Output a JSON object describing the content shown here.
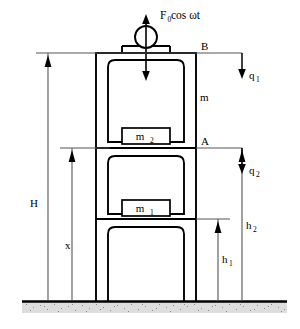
{
  "figure": {
    "background_color": "#ffffff",
    "line_color": "#000000",
    "ground_fill": "#d9d9d9"
  },
  "labels": {
    "force": "F",
    "force_sub": "0",
    "force_rest": " cos ωt",
    "point_b": "B",
    "point_a": "A",
    "column_mass": "m",
    "mass_2": "m",
    "mass_2_sub": "2",
    "mass_1": "m",
    "mass_1_sub": "1",
    "dim_H": "H",
    "dim_x": "x",
    "dim_h1": "h",
    "dim_h1_sub": "1",
    "dim_h2": "h",
    "dim_h2_sub": "2",
    "dof_q1": "q",
    "dof_q1_sub": "1",
    "dof_q2": "q",
    "dof_q2_sub": "2"
  },
  "geometry": {
    "ground_y": 300,
    "frame_left": 96,
    "frame_right": 196,
    "frame_top": 53,
    "level_b_y": 53,
    "level_a_y": 148,
    "level_mid_y": 219,
    "H_line_x": 48,
    "x_line_x": 72,
    "h1_line_x": 218,
    "h2_line_x": 242,
    "circle_cx": 146,
    "circle_cy": 37,
    "circle_r": 11
  },
  "masses": [
    {
      "name": "m2",
      "label": "m",
      "sub": "2",
      "y": 128
    },
    {
      "name": "m1",
      "label": "m",
      "sub": "1",
      "y": 200
    }
  ]
}
